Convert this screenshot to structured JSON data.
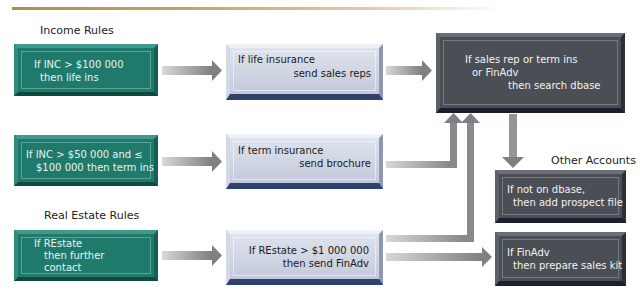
{
  "section_labels": {
    "income_rules": "Income Rules",
    "real_estate_rules": "Real Estate Rules",
    "other_accounts": "Other Accounts"
  },
  "income_rules": [
    {
      "line1": "If INC > $100 000",
      "line2": "then life ins"
    },
    {
      "line1": "If INC > $50 000 and ≤",
      "line2": "$100 000 then term ins"
    }
  ],
  "real_estate_rules": [
    {
      "line1": "If REstate",
      "line2": "then further",
      "line3": "contact"
    }
  ],
  "actions": [
    {
      "line1": "If life insurance",
      "line2": "send sales reps"
    },
    {
      "line1": "If term insurance",
      "line2": "send brochure"
    },
    {
      "line1": "If REstate > $1 000 000",
      "line2": "then send FinAdv"
    }
  ],
  "search": {
    "line1": "If sales rep or term ins",
    "line2": "or FinAdv",
    "line3": "then search dbase"
  },
  "other_accounts": [
    {
      "line1": "If not on dbase,",
      "line2": "then add prospect file"
    },
    {
      "line1": "If FinAdv",
      "line2": "then prepare sales kit"
    }
  ],
  "colors": {
    "rule_box": "#1f7a6c",
    "action_box": "#c8cede",
    "action_box_edge": "#2f426e",
    "dark_box": "#4b4f55",
    "arrow": "#8a8a8a",
    "top_rule": "#b98a45"
  }
}
